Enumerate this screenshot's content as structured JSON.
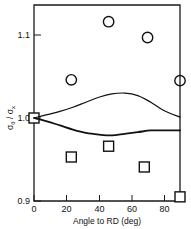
{
  "chart_data": {
    "type": "scatter",
    "title": "",
    "xlabel": "Angle to RD (deg)",
    "ylabel": "σθ / σx",
    "ylabel_parts": {
      "main1": "σ",
      "sub1": "θ",
      "slash": " / ",
      "main2": "σ",
      "sub2": "x"
    },
    "xlim": [
      0,
      90
    ],
    "ylim": [
      0.9,
      1.135
    ],
    "xticks": [
      0,
      20,
      40,
      60,
      80
    ],
    "xtick_labels": [
      "0",
      "20",
      "40",
      "60",
      "80"
    ],
    "yticks": [
      0.9,
      1.0,
      1.1
    ],
    "ytick_labels": [
      "0.9",
      "1.0",
      "1.1"
    ],
    "grid": false,
    "legend": null,
    "series": [
      {
        "name": "circle-markers",
        "marker": "circle",
        "points": [
          {
            "x": 23,
            "y": 1.046
          },
          {
            "x": 46,
            "y": 1.116
          },
          {
            "x": 70,
            "y": 1.097
          },
          {
            "x": 90,
            "y": 1.045
          }
        ]
      },
      {
        "name": "square-markers",
        "marker": "square",
        "points": [
          {
            "x": 0,
            "y": 1.0
          },
          {
            "x": 23,
            "y": 0.953
          },
          {
            "x": 46,
            "y": 0.966
          },
          {
            "x": 68,
            "y": 0.941
          },
          {
            "x": 90,
            "y": 0.905
          }
        ]
      },
      {
        "name": "upper-curve",
        "marker": "line",
        "points": [
          {
            "x": 0,
            "y": 1.0
          },
          {
            "x": 8,
            "y": 1.004
          },
          {
            "x": 16,
            "y": 1.008
          },
          {
            "x": 24,
            "y": 1.013
          },
          {
            "x": 32,
            "y": 1.019
          },
          {
            "x": 40,
            "y": 1.025
          },
          {
            "x": 48,
            "y": 1.029
          },
          {
            "x": 56,
            "y": 1.03
          },
          {
            "x": 64,
            "y": 1.027
          },
          {
            "x": 72,
            "y": 1.019
          },
          {
            "x": 80,
            "y": 1.009
          },
          {
            "x": 90,
            "y": 1.001
          }
        ]
      },
      {
        "name": "lower-curve",
        "marker": "line",
        "points": [
          {
            "x": 0,
            "y": 1.0
          },
          {
            "x": 8,
            "y": 0.996
          },
          {
            "x": 16,
            "y": 0.991
          },
          {
            "x": 24,
            "y": 0.986
          },
          {
            "x": 32,
            "y": 0.982
          },
          {
            "x": 40,
            "y": 0.98
          },
          {
            "x": 48,
            "y": 0.979
          },
          {
            "x": 56,
            "y": 0.981
          },
          {
            "x": 64,
            "y": 0.983
          },
          {
            "x": 72,
            "y": 0.985
          },
          {
            "x": 80,
            "y": 0.985
          },
          {
            "x": 90,
            "y": 0.985
          }
        ]
      }
    ]
  },
  "axes": {
    "x_title": "Angle to RD (deg)",
    "y_tick_top": "1.1",
    "y_tick_mid": "1.0",
    "y_tick_bottom": "0.9",
    "x_tick_0": "0",
    "x_tick_20": "20",
    "x_tick_40": "40",
    "x_tick_60": "60",
    "x_tick_80": "80"
  },
  "style": {
    "axis_color": "#1a1a1a",
    "marker_color": "#111111",
    "background": "#ffffff"
  }
}
